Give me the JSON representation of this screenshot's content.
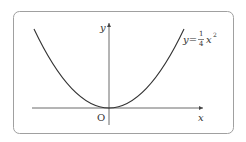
{
  "diagram": {
    "type": "function-graph",
    "equation": {
      "lhs": "y=",
      "numerator": "1",
      "denominator": "4",
      "variable": "x",
      "exponent": "2"
    },
    "axes": {
      "x_label": "x",
      "y_label": "y",
      "origin_label": "O"
    },
    "colors": {
      "frame": "#9a9a9a",
      "curve": "#333333",
      "axis": "#444444"
    }
  }
}
